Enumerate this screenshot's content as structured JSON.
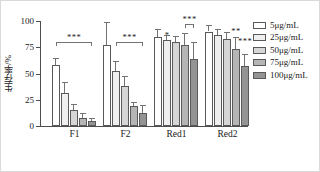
{
  "chart_data": {
    "type": "bar",
    "title": "",
    "xlabel": "",
    "ylabel": "生存率/%",
    "ylim": [
      0,
      100
    ],
    "yticks": [
      0,
      25,
      50,
      75,
      100
    ],
    "ytick_labels": [
      "0",
      "25",
      "50",
      "75",
      "100"
    ],
    "grid": false,
    "legend_position": "right",
    "categories": [
      "F1",
      "F2",
      "Red1",
      "Red2"
    ],
    "series": [
      {
        "name": "5μg/mL",
        "color": "#ffffff",
        "values": [
          58,
          77,
          85,
          90
        ],
        "errors": [
          7,
          22,
          7,
          6
        ]
      },
      {
        "name": "25μg/mL",
        "color": "#efefef",
        "values": [
          31,
          52,
          82,
          87
        ],
        "errors": [
          11,
          10,
          5,
          5
        ]
      },
      {
        "name": "50μg/mL",
        "color": "#d6d6d6",
        "values": [
          15,
          38,
          80,
          83
        ],
        "errors": [
          6,
          10,
          6,
          7
        ]
      },
      {
        "name": "75μg/mL",
        "color": "#b5b5b5",
        "values": [
          8,
          19,
          77,
          73
        ],
        "errors": [
          4,
          4,
          12,
          12
        ]
      },
      {
        "name": "100μg/mL",
        "color": "#949494",
        "values": [
          5,
          12,
          64,
          57
        ],
        "errors": [
          3,
          8,
          16,
          12
        ]
      }
    ],
    "annotations": [
      {
        "group": "F1",
        "label": "***",
        "type": "bracket",
        "from_bar": 0,
        "to_bar": 4,
        "y": 80
      },
      {
        "group": "F2",
        "label": "***",
        "type": "bracket",
        "from_bar": 1,
        "to_bar": 4,
        "y": 80
      },
      {
        "group": "Red1",
        "label": "*",
        "type": "star",
        "bar": 1,
        "y": 90
      },
      {
        "group": "Red1",
        "label": "***",
        "type": "bracket",
        "from_bar": 3,
        "to_bar": 4,
        "y": 97
      },
      {
        "group": "Red2",
        "label": "**",
        "type": "star",
        "bar": 3,
        "y": 93
      },
      {
        "group": "Red2",
        "label": "***",
        "type": "star",
        "bar": 4,
        "y": 84
      }
    ]
  },
  "legend": {
    "items": [
      {
        "label": "5μg/mL"
      },
      {
        "label": "25μg/mL"
      },
      {
        "label": "50μg/mL"
      },
      {
        "label": "75μg/mL"
      },
      {
        "label": "100μg/mL"
      }
    ]
  }
}
